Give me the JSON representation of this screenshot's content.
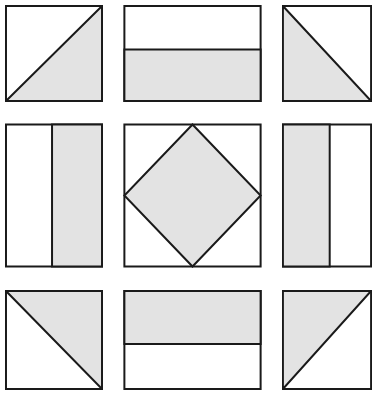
{
  "figure": {
    "grid": {
      "rows": 3,
      "columns": 3
    },
    "background_color": "#ffffff",
    "fill_color": "#e3e3e3",
    "stroke_color": "#1a1a1a",
    "stroke_width": 2
  },
  "chart_data": {
    "type": "table",
    "xlabel": "",
    "ylabel": "",
    "grid": true,
    "legend": "none",
    "categories": [
      "column-1",
      "column-2",
      "column-3"
    ],
    "row_labels": [
      "row-1",
      "row-2",
      "row-3"
    ],
    "cells": [
      {
        "id": "cell-1",
        "row": 1,
        "column": 1,
        "shape": "half-square-triangle",
        "description": "Square divided by a diagonal from bottom-left to top-right; lower-right half shaded",
        "diagonal": "bottom-left-to-top-right",
        "shaded_region": "lower-right",
        "shaded_fraction": 0.5
      },
      {
        "id": "cell-2",
        "row": 1,
        "column": 2,
        "shape": "horizontally-split-rectangle",
        "description": "Wide rectangle split by a horizontal line; lower band shaded",
        "split_axis": "horizontal",
        "split_position": 0.46,
        "shaded_region": "bottom",
        "shaded_fraction": 0.54
      },
      {
        "id": "cell-3",
        "row": 1,
        "column": 3,
        "shape": "half-square-triangle",
        "description": "Square divided by a diagonal from top-left to bottom-right; lower-left half shaded",
        "diagonal": "top-left-to-bottom-right",
        "shaded_region": "lower-left",
        "shaded_fraction": 0.5
      },
      {
        "id": "cell-4",
        "row": 2,
        "column": 1,
        "shape": "vertically-split-rectangle",
        "description": "Tall rectangle split by a vertical line; right band shaded",
        "split_axis": "vertical",
        "split_position": 0.48,
        "shaded_region": "right",
        "shaded_fraction": 0.52
      },
      {
        "id": "cell-5",
        "row": 2,
        "column": 2,
        "shape": "inscribed-diamond",
        "description": "Square containing a shaded diamond whose vertices touch the midpoints of each side",
        "vertices": "side-midpoints",
        "shaded_region": "diamond",
        "shaded_fraction": 0.5
      },
      {
        "id": "cell-6",
        "row": 2,
        "column": 3,
        "shape": "vertically-split-rectangle",
        "description": "Tall rectangle split by a vertical line; left band shaded",
        "split_axis": "vertical",
        "split_position": 0.53,
        "shaded_region": "left",
        "shaded_fraction": 0.53
      },
      {
        "id": "cell-7",
        "row": 3,
        "column": 1,
        "shape": "half-square-triangle",
        "description": "Square divided by a diagonal from top-left to bottom-right; upper-right half shaded",
        "diagonal": "top-left-to-bottom-right",
        "shaded_region": "upper-right",
        "shaded_fraction": 0.5
      },
      {
        "id": "cell-8",
        "row": 3,
        "column": 2,
        "shape": "horizontally-split-rectangle",
        "description": "Wide rectangle split by a horizontal line; upper band shaded",
        "split_axis": "horizontal",
        "split_position": 0.54,
        "shaded_region": "top",
        "shaded_fraction": 0.54
      },
      {
        "id": "cell-9",
        "row": 3,
        "column": 3,
        "shape": "half-square-triangle",
        "description": "Square divided by a diagonal from bottom-left to top-right; upper-left half shaded",
        "diagonal": "bottom-left-to-top-right",
        "shaded_region": "upper-left",
        "shaded_fraction": 0.5
      }
    ]
  }
}
